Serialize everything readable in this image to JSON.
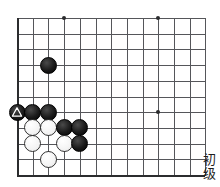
{
  "diagram": {
    "type": "go-board-problem",
    "level_label_chars": [
      "初",
      "级"
    ],
    "level_label": "初级",
    "board": {
      "visible_cols": 12,
      "visible_rows": 10,
      "cell_size": 15.7,
      "line_color": "#55565a",
      "edge_color": "#2b2c2e",
      "background": "#ffffff"
    },
    "star_points": [
      {
        "col": 3,
        "row": 0
      },
      {
        "col": 9,
        "row": 0
      },
      {
        "col": 9,
        "row": 6
      }
    ],
    "stones": [
      {
        "col": 2,
        "row": 3,
        "color": "black",
        "marker": "none"
      },
      {
        "col": 0,
        "row": 6,
        "color": "black",
        "marker": "triangle"
      },
      {
        "col": 1,
        "row": 6,
        "color": "black",
        "marker": "none"
      },
      {
        "col": 2,
        "row": 6,
        "color": "black",
        "marker": "none"
      },
      {
        "col": 1,
        "row": 7,
        "color": "white",
        "marker": "none"
      },
      {
        "col": 2,
        "row": 7,
        "color": "white",
        "marker": "none"
      },
      {
        "col": 3,
        "row": 7,
        "color": "black",
        "marker": "none"
      },
      {
        "col": 4,
        "row": 7,
        "color": "black",
        "marker": "none"
      },
      {
        "col": 1,
        "row": 8,
        "color": "white",
        "marker": "none"
      },
      {
        "col": 3,
        "row": 8,
        "color": "white",
        "marker": "none"
      },
      {
        "col": 4,
        "row": 8,
        "color": "black",
        "marker": "none"
      },
      {
        "col": 2,
        "row": 9,
        "color": "white",
        "marker": "none"
      }
    ]
  }
}
